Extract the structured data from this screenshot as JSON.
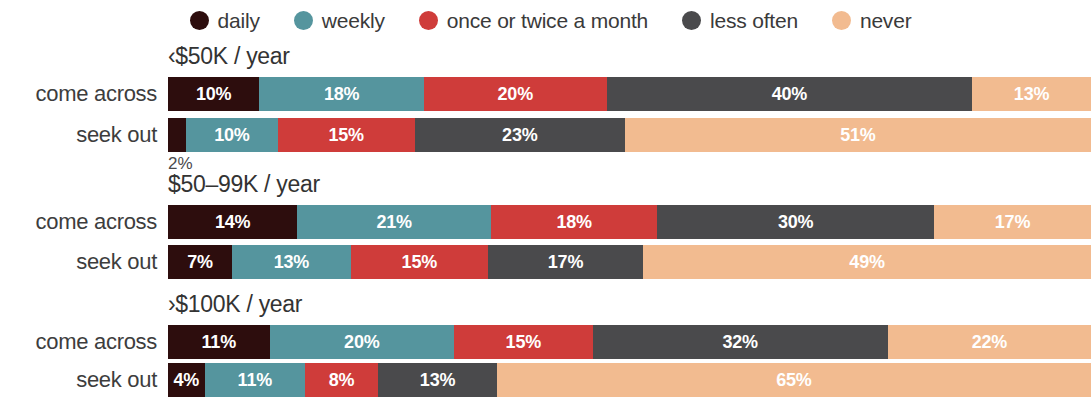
{
  "legend": {
    "position": "top-center",
    "items": [
      {
        "label": "daily",
        "color": "#2d0d0d",
        "icon": "circle-swatch-icon"
      },
      {
        "label": "weekly",
        "color": "#55959e",
        "icon": "circle-swatch-icon"
      },
      {
        "label": "once or twice a month",
        "color": "#cf3c3a",
        "icon": "circle-swatch-icon"
      },
      {
        "label": "less often",
        "color": "#4a4a4c",
        "icon": "circle-swatch-icon"
      },
      {
        "label": "never",
        "color": "#f2bb90",
        "icon": "circle-swatch-icon"
      }
    ]
  },
  "chart_data": {
    "type": "bar",
    "orientation": "horizontal",
    "stacked": true,
    "title": "",
    "subtitle": "",
    "xlabel": "",
    "ylabel": "",
    "xlim": [
      0,
      100
    ],
    "grid": false,
    "value_suffix": "%",
    "series": [
      {
        "name": "daily",
        "color": "#2d0d0d"
      },
      {
        "name": "weekly",
        "color": "#55959e"
      },
      {
        "name": "once or twice a month",
        "color": "#cf3c3a"
      },
      {
        "name": "less often",
        "color": "#4a4a4c"
      },
      {
        "name": "never",
        "color": "#f2bb90"
      }
    ],
    "groups": [
      {
        "title": "‹$50K / year",
        "rows": [
          {
            "label": "come across",
            "values": [
              10,
              18,
              20,
              40,
              13
            ],
            "labels": [
              "10%",
              "18%",
              "20%",
              "40%",
              "13%"
            ],
            "outside_label": null
          },
          {
            "label": "seek out",
            "values": [
              2,
              10,
              15,
              23,
              51
            ],
            "labels": [
              "2%",
              "10%",
              "15%",
              "23%",
              "51%"
            ],
            "outside_label": "2%"
          }
        ]
      },
      {
        "title": "$50–99K / year",
        "rows": [
          {
            "label": "come across",
            "values": [
              14,
              21,
              18,
              30,
              17
            ],
            "labels": [
              "14%",
              "21%",
              "18%",
              "30%",
              "17%"
            ],
            "outside_label": null
          },
          {
            "label": "seek out",
            "values": [
              7,
              13,
              15,
              17,
              49
            ],
            "labels": [
              "7%",
              "13%",
              "15%",
              "17%",
              "49%"
            ],
            "outside_label": null
          }
        ]
      },
      {
        "title": "›$100K / year",
        "rows": [
          {
            "label": "come across",
            "values": [
              11,
              20,
              15,
              32,
              22
            ],
            "labels": [
              "11%",
              "20%",
              "15%",
              "32%",
              "22%"
            ],
            "outside_label": null
          },
          {
            "label": "seek out",
            "values": [
              4,
              11,
              8,
              13,
              65
            ],
            "labels": [
              "4%",
              "11%",
              "8%",
              "13%",
              "65%"
            ],
            "outside_label": null
          }
        ]
      }
    ]
  }
}
